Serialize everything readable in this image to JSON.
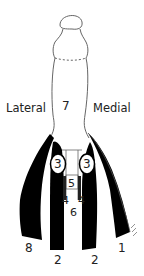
{
  "diagram": {
    "colors": {
      "background": "#ffffff",
      "ink": "#000000",
      "label": "#222222",
      "outline": "#555555"
    },
    "side_labels": {
      "lateral": "Lateral",
      "medial": "Medial"
    },
    "numbers": {
      "n7": "7",
      "n3_left": "3",
      "n3_right": "3",
      "n5": "5",
      "n4_left": "4",
      "n4_right": "4",
      "n6": "6",
      "n8": "8",
      "n2_left": "2",
      "n2_right": "2",
      "n1": "1"
    }
  }
}
